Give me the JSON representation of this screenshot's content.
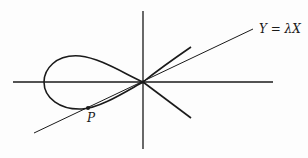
{
  "diagram": {
    "line_label": "Y = λX",
    "point_label": "P",
    "colors": {
      "ink": "#1a1a1a",
      "background": "#fdfdfd"
    },
    "axes": {
      "x_axis": {
        "x1": 13,
        "y1": 82,
        "x2": 273,
        "y2": 82
      },
      "y_axis": {
        "x1": 143,
        "y1": 11,
        "x2": 143,
        "y2": 149
      }
    },
    "line": {
      "x1": 34,
      "y1": 133,
      "x2": 253,
      "y2": 29
    },
    "point_P": {
      "x": 88,
      "y": 108
    }
  }
}
